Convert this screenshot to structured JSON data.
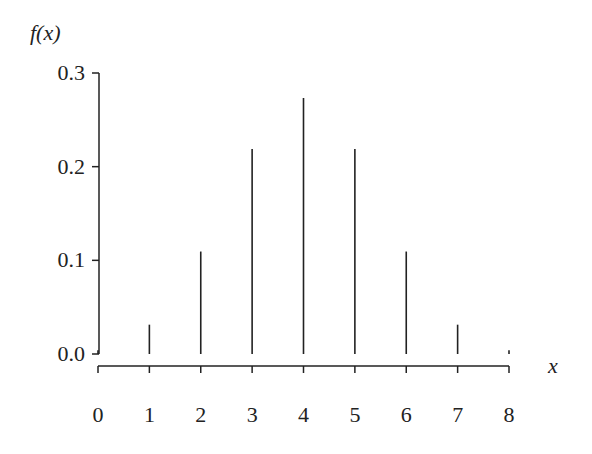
{
  "chart_data": {
    "type": "bar",
    "style": "stem",
    "title": "",
    "xlabel": "x",
    "ylabel": "f(x)",
    "x": [
      0,
      1,
      2,
      3,
      4,
      5,
      6,
      7,
      8
    ],
    "categories": [
      "0",
      "1",
      "2",
      "3",
      "4",
      "5",
      "6",
      "7",
      "8"
    ],
    "values": [
      0.0039,
      0.0313,
      0.1094,
      0.2188,
      0.2734,
      0.2188,
      0.1094,
      0.0313,
      0.0039
    ],
    "xlim": [
      0,
      8
    ],
    "ylim": [
      0,
      0.3
    ],
    "yticks": [
      0.0,
      0.1,
      0.2,
      0.3
    ],
    "ytick_labels": [
      "0.0",
      "0.1",
      "0.2",
      "0.3"
    ],
    "xticks": [
      0,
      1,
      2,
      3,
      4,
      5,
      6,
      7,
      8
    ],
    "xtick_labels": [
      "0",
      "1",
      "2",
      "3",
      "4",
      "5",
      "6",
      "7",
      "8"
    ],
    "grid": false,
    "legend": null,
    "color": "#222222"
  },
  "labels": {
    "y_axis_title": "f(x)",
    "x_axis_title": "x"
  }
}
